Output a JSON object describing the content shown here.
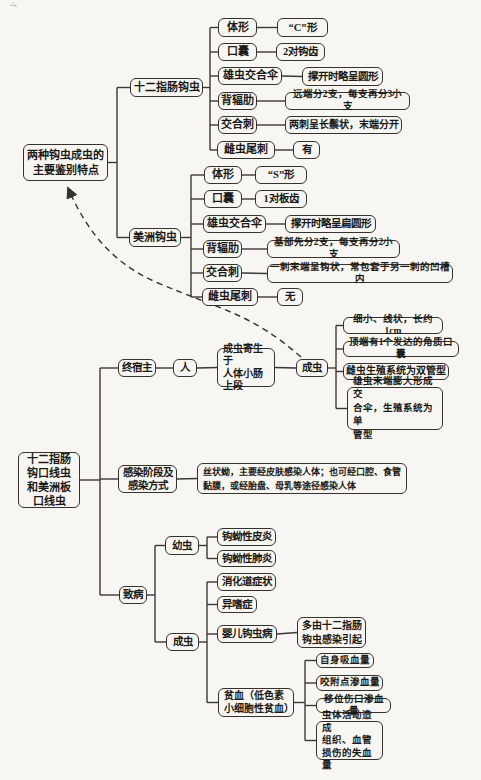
{
  "page": {
    "kind": "scanned textbook mind-map",
    "language": "zh-CN"
  },
  "diagram": {
    "colors": {
      "background": "#f7f6f2",
      "line": "#3b3936",
      "text": "#1b1a17",
      "border": "#35332e"
    },
    "nodes": [
      {
        "id": "rootA",
        "name": "features-root",
        "label": "两种钩虫成虫的\n主要鉴别特点",
        "box": [
          23,
          144,
          85,
          37
        ],
        "fs": 11,
        "lh": 15
      },
      {
        "id": "duo",
        "name": "ancylostoma-duodenale",
        "label": "十二指肠钩虫",
        "box": [
          130,
          78,
          73,
          19
        ],
        "fs": 11
      },
      {
        "id": "duo_tixing",
        "name": "duodenale-body-shape-label",
        "label": "体形",
        "box": [
          218,
          18,
          39,
          19
        ],
        "fs": 11
      },
      {
        "id": "duo_tixing_v",
        "name": "duodenale-body-shape-value",
        "label": "“C”形",
        "box": [
          277,
          18,
          51,
          19
        ],
        "fs": 10.5
      },
      {
        "id": "duo_kounang",
        "name": "duodenale-buccal-capsule-label",
        "label": "口囊",
        "box": [
          218,
          43,
          39,
          18
        ],
        "fs": 11
      },
      {
        "id": "duo_kounang_v",
        "name": "duodenale-buccal-capsule-value",
        "label": "2对钩齿",
        "box": [
          276,
          43,
          49,
          18
        ],
        "fs": 10.5
      },
      {
        "id": "duo_san",
        "name": "duodenale-copulatory-bursa-label",
        "label": "雄虫交合伞",
        "box": [
          218,
          67,
          64,
          18
        ],
        "fs": 11
      },
      {
        "id": "duo_san_v",
        "name": "duodenale-copulatory-bursa-value",
        "label": "撑开时略呈圆形",
        "box": [
          302,
          67,
          81,
          19
        ],
        "fs": 10.5
      },
      {
        "id": "duo_beile",
        "name": "duodenale-dorsal-ray-label",
        "label": "背辐肋",
        "box": [
          218,
          92,
          39,
          18
        ],
        "fs": 11
      },
      {
        "id": "duo_beile_v",
        "name": "duodenale-dorsal-ray-value",
        "label": "远端分2支，每支再分3小支",
        "box": [
          285,
          92,
          125,
          18
        ],
        "fs": 9.5
      },
      {
        "id": "duo_ci",
        "name": "duodenale-spicule-label",
        "label": "交合刺",
        "box": [
          218,
          116,
          39,
          18
        ],
        "fs": 11
      },
      {
        "id": "duo_ci_v",
        "name": "duodenale-spicule-value",
        "label": "两刺呈长鬃状，末端分开",
        "box": [
          285,
          116,
          117,
          18
        ],
        "fs": 10
      },
      {
        "id": "duo_wei",
        "name": "duodenale-caudal-spine-label",
        "label": "雌虫尾刺",
        "box": [
          217,
          141,
          58,
          18
        ],
        "fs": 11
      },
      {
        "id": "duo_wei_v",
        "name": "duodenale-caudal-spine-value",
        "label": "有",
        "box": [
          293,
          141,
          27,
          18
        ],
        "fs": 10.5
      },
      {
        "id": "mei",
        "name": "necator-americanus",
        "label": "美洲钩虫",
        "box": [
          129,
          228,
          52,
          19
        ],
        "fs": 11
      },
      {
        "id": "mei_tixing",
        "name": "americanus-body-shape-label",
        "label": "体形",
        "box": [
          204,
          166,
          38,
          18
        ],
        "fs": 11
      },
      {
        "id": "mei_tixing_v",
        "name": "americanus-body-shape-value",
        "label": "“S”形",
        "box": [
          255,
          166,
          52,
          18
        ],
        "fs": 10.5
      },
      {
        "id": "mei_kounang",
        "name": "americanus-buccal-capsule-label",
        "label": "口囊",
        "box": [
          204,
          190,
          38,
          18
        ],
        "fs": 11
      },
      {
        "id": "mei_kounang_v",
        "name": "americanus-buccal-capsule-value",
        "label": "1对板齿",
        "box": [
          255,
          190,
          52,
          18
        ],
        "fs": 10.5
      },
      {
        "id": "mei_san",
        "name": "americanus-copulatory-bursa-label",
        "label": "雄虫交合伞",
        "box": [
          203,
          215,
          63,
          18
        ],
        "fs": 11
      },
      {
        "id": "mei_san_v",
        "name": "americanus-copulatory-bursa-value",
        "label": "撑开时略呈扁圆形",
        "box": [
          285,
          215,
          91,
          18
        ],
        "fs": 10.5
      },
      {
        "id": "mei_beile",
        "name": "americanus-dorsal-ray-label",
        "label": "背辐肋",
        "box": [
          203,
          240,
          39,
          18
        ],
        "fs": 11
      },
      {
        "id": "mei_beile_v",
        "name": "americanus-dorsal-ray-value",
        "label": "基部先分2支，每支再分2小支",
        "box": [
          267,
          240,
          133,
          18
        ],
        "fs": 9.5
      },
      {
        "id": "mei_ci",
        "name": "americanus-spicule-label",
        "label": "交合刺",
        "box": [
          203,
          264,
          39,
          18
        ],
        "fs": 11
      },
      {
        "id": "mei_ci_v",
        "name": "americanus-spicule-value",
        "label": "一刺末端呈钩状，常包套于另一刺的凹槽内",
        "box": [
          267,
          264,
          186,
          19
        ],
        "fs": 9.5
      },
      {
        "id": "mei_wei",
        "name": "americanus-caudal-spine-label",
        "label": "雌虫尾刺",
        "box": [
          202,
          288,
          56,
          18
        ],
        "fs": 11
      },
      {
        "id": "mei_wei_v",
        "name": "americanus-caudal-spine-value",
        "label": "无",
        "box": [
          277,
          288,
          26,
          18
        ],
        "fs": 10.5
      },
      {
        "id": "rootB",
        "name": "hookworms-root",
        "label": "十二指肠\n钩口线虫\n和美洲板\n口线虫",
        "box": [
          18,
          452,
          62,
          56
        ],
        "fs": 11,
        "lh": 14
      },
      {
        "id": "host",
        "name": "final-host-label",
        "label": "终宿主",
        "box": [
          118,
          359,
          38,
          18
        ],
        "fs": 10.5
      },
      {
        "id": "human",
        "name": "human-host",
        "label": "人",
        "box": [
          173,
          359,
          24,
          18
        ],
        "fs": 10.5
      },
      {
        "id": "parasit",
        "name": "adult-habitat",
        "label": "成虫寄生于\n人体小肠\n上段",
        "box": [
          217,
          348,
          58,
          39
        ],
        "fs": 10,
        "lh": 12.5,
        "align": "left"
      },
      {
        "id": "adult1",
        "name": "adult-worm",
        "label": "成虫",
        "box": [
          296,
          359,
          32,
          18
        ],
        "fs": 10.5
      },
      {
        "id": "a1",
        "name": "adult-feature-size",
        "label": "细小、线状，长约1cm",
        "box": [
          343,
          317,
          100,
          17
        ],
        "fs": 9.5
      },
      {
        "id": "a2",
        "name": "adult-feature-buccal-capsule",
        "label": "顶端有1个发达的角质口囊",
        "box": [
          343,
          341,
          116,
          16
        ],
        "fs": 9.5
      },
      {
        "id": "a3",
        "name": "adult-feature-female-system",
        "label": "雌虫生殖系统为双管型",
        "box": [
          343,
          363,
          106,
          17
        ],
        "fs": 10
      },
      {
        "id": "a4",
        "name": "adult-feature-male-system",
        "label": "雄虫末端膨大形成交\n合伞，生殖系统为单\n管型",
        "box": [
          347,
          387,
          96,
          43
        ],
        "fs": 9.5,
        "lh": 13.5,
        "align": "left"
      },
      {
        "id": "infect",
        "name": "infection-stage-label",
        "label": "感染阶段及\n感染方式",
        "box": [
          118,
          465,
          59,
          28
        ],
        "fs": 10.5,
        "lh": 13
      },
      {
        "id": "infect_v",
        "name": "infection-stage-value",
        "label": "丝状蚴，主要经皮肤感染人体；也可经口腔、食管\n黏膜，或经胎盘、母乳等途径感染人体",
        "box": [
          197,
          463,
          210,
          31
        ],
        "fs": 9,
        "lh": 14,
        "align": "left"
      },
      {
        "id": "patho",
        "name": "pathogenesis-label",
        "label": "致病",
        "box": [
          119,
          586,
          28,
          18
        ],
        "fs": 10.5
      },
      {
        "id": "larva",
        "name": "larva-label",
        "label": "幼虫",
        "box": [
          165,
          536,
          34,
          19
        ],
        "fs": 10.5
      },
      {
        "id": "l1",
        "name": "larval-dermatitis",
        "label": "钩蚴性皮炎",
        "box": [
          217,
          528,
          59,
          18
        ],
        "fs": 10.5
      },
      {
        "id": "l2",
        "name": "larval-pneumonitis",
        "label": "钩蚴性肺炎",
        "box": [
          217,
          550,
          59,
          17
        ],
        "fs": 10.5
      },
      {
        "id": "adult2",
        "name": "adult-pathogenesis-label",
        "label": "成虫",
        "box": [
          166,
          633,
          33,
          18
        ],
        "fs": 10.5
      },
      {
        "id": "g1",
        "name": "gi-symptoms",
        "label": "消化道症状",
        "box": [
          217,
          573,
          59,
          18
        ],
        "fs": 10.5
      },
      {
        "id": "g2",
        "name": "pica",
        "label": "异嗜症",
        "box": [
          217,
          596,
          40,
          17
        ],
        "fs": 10.5
      },
      {
        "id": "g3",
        "name": "infant-hookworm-disease",
        "label": "婴儿钩虫病",
        "box": [
          217,
          625,
          60,
          18
        ],
        "fs": 10.5
      },
      {
        "id": "g3v",
        "name": "infant-hookworm-cause",
        "label": "多由十二指肠\n钩虫感染引起",
        "box": [
          297,
          617,
          69,
          31
        ],
        "fs": 10,
        "lh": 13.5
      },
      {
        "id": "g4",
        "name": "anemia",
        "label": "贫血（低色素\n小细胞性贫血）",
        "box": [
          218,
          688,
          76,
          29
        ],
        "fs": 10,
        "lh": 12.5,
        "align": "left"
      },
      {
        "id": "b1",
        "name": "blood-loss-self-sucking",
        "label": "自身吸血量",
        "box": [
          316,
          653,
          58,
          15
        ],
        "fs": 9.5
      },
      {
        "id": "b2",
        "name": "blood-loss-bite-site",
        "label": "咬附点渗血量",
        "box": [
          316,
          675,
          67,
          16
        ],
        "fs": 9.5
      },
      {
        "id": "b3",
        "name": "blood-loss-migration-wound",
        "label": "移位伤口渗血量",
        "box": [
          316,
          698,
          75,
          15
        ],
        "fs": 9.5
      },
      {
        "id": "b4",
        "name": "blood-loss-tissue-damage",
        "label": "虫体活动造成\n组织、血管\n损伤的失血量",
        "box": [
          316,
          721,
          67,
          39
        ],
        "fs": 9.5,
        "lh": 12.5,
        "align": "left"
      }
    ],
    "links": [
      {
        "parent": "rootA",
        "children": [
          "duo",
          "mei"
        ],
        "trunk_x": 117
      },
      {
        "parent": "duo",
        "children": [
          "duo_tixing",
          "duo_kounang",
          "duo_san",
          "duo_beile",
          "duo_ci",
          "duo_wei"
        ],
        "trunk_x": 210
      },
      {
        "parent": "duo_tixing",
        "children": [
          "duo_tixing_v"
        ]
      },
      {
        "parent": "duo_kounang",
        "children": [
          "duo_kounang_v"
        ]
      },
      {
        "parent": "duo_san",
        "children": [
          "duo_san_v"
        ]
      },
      {
        "parent": "duo_beile",
        "children": [
          "duo_beile_v"
        ]
      },
      {
        "parent": "duo_ci",
        "children": [
          "duo_ci_v"
        ]
      },
      {
        "parent": "duo_wei",
        "children": [
          "duo_wei_v"
        ]
      },
      {
        "parent": "mei",
        "children": [
          "mei_tixing",
          "mei_kounang",
          "mei_san",
          "mei_beile",
          "mei_ci",
          "mei_wei"
        ],
        "trunk_x": 191
      },
      {
        "parent": "mei_tixing",
        "children": [
          "mei_tixing_v"
        ]
      },
      {
        "parent": "mei_kounang",
        "children": [
          "mei_kounang_v"
        ]
      },
      {
        "parent": "mei_san",
        "children": [
          "mei_san_v"
        ]
      },
      {
        "parent": "mei_beile",
        "children": [
          "mei_beile_v"
        ]
      },
      {
        "parent": "mei_ci",
        "children": [
          "mei_ci_v"
        ]
      },
      {
        "parent": "mei_wei",
        "children": [
          "mei_wei_v"
        ]
      },
      {
        "parent": "rootB",
        "children": [
          "host",
          "infect",
          "patho"
        ],
        "trunk_x": 100
      },
      {
        "parent": "host",
        "children": [
          "human"
        ]
      },
      {
        "parent": "human",
        "children": [
          "parasit"
        ]
      },
      {
        "parent": "parasit",
        "children": [
          "adult1"
        ]
      },
      {
        "parent": "adult1",
        "children": [
          "a1",
          "a2",
          "a3",
          "a4"
        ],
        "trunk_x": 336
      },
      {
        "parent": "infect",
        "children": [
          "infect_v"
        ]
      },
      {
        "parent": "patho",
        "children": [
          "larva",
          "adult2"
        ],
        "trunk_x": 155
      },
      {
        "parent": "larva",
        "children": [
          "l1",
          "l2"
        ],
        "trunk_x": 207
      },
      {
        "parent": "adult2",
        "children": [
          "g1",
          "g2",
          "g3",
          "g4"
        ],
        "trunk_x": 207
      },
      {
        "parent": "g3",
        "children": [
          "g3v"
        ]
      },
      {
        "parent": "g4",
        "children": [
          "b1",
          "b2",
          "b3",
          "b4"
        ],
        "trunk_x": 305
      }
    ],
    "dashed_arrow": {
      "from": "adult1",
      "to": "rootA",
      "style": "dashed",
      "arrowhead": "at-rootA"
    }
  }
}
